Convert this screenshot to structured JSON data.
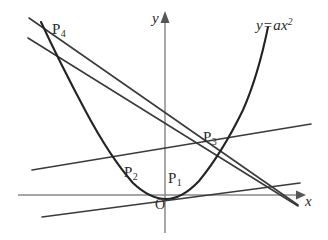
{
  "figure": {
    "kind": "coordinate-geometry-diagram",
    "background_color": "#ffffff",
    "curve_color": "#232323",
    "line_color": "#3a3a3a",
    "axis_color": "#8a8a8a",
    "text_color": "#2b2b2b"
  },
  "axes": {
    "x_label": "x",
    "y_label": "y",
    "origin_label": "O",
    "origin_px": {
      "x": 165,
      "y": 195
    },
    "x_axis_px": {
      "x1": 18,
      "y1": 195,
      "x2": 303,
      "y2": 195
    },
    "y_axis_px": {
      "x1": 165,
      "y1": 13,
      "x2": 165,
      "y2": 233
    }
  },
  "curve": {
    "equation_label": "y=ax",
    "equation_exponent": "2",
    "equation_pos_px": {
      "x": 256,
      "y": 18
    },
    "type": "parabola",
    "vertex_px": {
      "x": 166,
      "y": 199
    },
    "opens": "up",
    "left_end_px": {
      "x": 41,
      "y": 22
    },
    "right_end_px": {
      "x": 268,
      "y": 27
    }
  },
  "points": [
    {
      "id": "P1",
      "base": "P",
      "sub": "1",
      "label_px": {
        "x": 168,
        "y": 171
      },
      "node_px": {
        "x": 182,
        "y": 192
      }
    },
    {
      "id": "P2",
      "base": "P",
      "sub": "2",
      "label_px": {
        "x": 124,
        "y": 165
      },
      "node_px": {
        "x": 133,
        "y": 187
      }
    },
    {
      "id": "P3",
      "base": "P",
      "sub": "3",
      "label_px": {
        "x": 203,
        "y": 130
      },
      "node_px": {
        "x": 218,
        "y": 158
      }
    },
    {
      "id": "P4",
      "base": "P",
      "sub": "4",
      "label_px": {
        "x": 52,
        "y": 22
      },
      "node_px": {
        "x": 57,
        "y": 55
      }
    }
  ],
  "lines": [
    {
      "id": "line-p4-p1",
      "from_px": {
        "x": 29,
        "y": 18
      },
      "to_px": {
        "x": 298,
        "y": 205
      }
    },
    {
      "id": "line-p4-p3",
      "from_px": {
        "x": 28,
        "y": 38
      },
      "to_px": {
        "x": 298,
        "y": 206
      }
    },
    {
      "id": "line-p2-p3",
      "from_px": {
        "x": 32,
        "y": 170
      },
      "to_px": {
        "x": 311,
        "y": 124
      }
    },
    {
      "id": "line-p1-p2",
      "from_px": {
        "x": 42,
        "y": 217
      },
      "to_px": {
        "x": 300,
        "y": 183
      }
    }
  ]
}
